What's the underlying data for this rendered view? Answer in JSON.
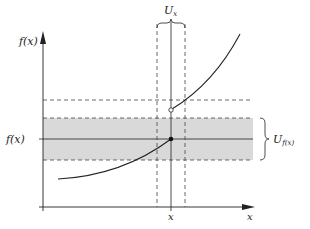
{
  "diagram": {
    "axes": {
      "y_label": "f(x)",
      "x_label": "x"
    },
    "labels": {
      "neighborhood_x": "U",
      "neighborhood_x_sub": "x",
      "neighborhood_fx": "U",
      "neighborhood_fx_sub": "f(x)",
      "point_x": "x",
      "value_fx": "f(x)"
    },
    "colors": {
      "band_fill": "#d9d9d9",
      "line": "#222222",
      "dash": "#444444",
      "background": "#ffffff"
    }
  }
}
